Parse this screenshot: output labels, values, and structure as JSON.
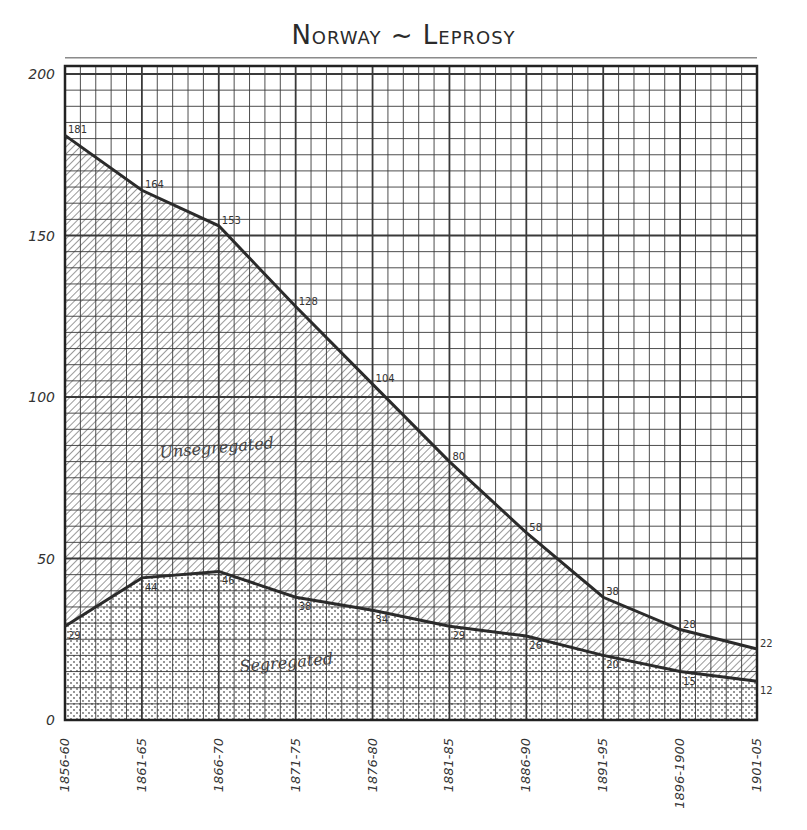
{
  "title": "Norway ~ Leprosy",
  "chart_data": {
    "type": "area",
    "title": "Norway ~ Leprosy",
    "xlabel": "",
    "ylabel": "",
    "ylim": [
      0,
      200
    ],
    "yticks": [
      0,
      50,
      100,
      150,
      200
    ],
    "grid": true,
    "legend": "inline labels",
    "categories": [
      "1856-60",
      "1861-65",
      "1866-70",
      "1871-75",
      "1876-80",
      "1881-85",
      "1886-90",
      "1891-95",
      "1896-1900",
      "1901-05"
    ],
    "series": [
      {
        "name": "Total (top line)",
        "values": [
          181,
          164,
          153,
          128,
          104,
          80,
          58,
          38,
          28,
          22
        ]
      },
      {
        "name": "Segregated",
        "values": [
          29,
          44,
          46,
          38,
          34,
          29,
          26,
          20,
          15,
          12
        ]
      }
    ],
    "area_labels": {
      "upper": "Unsegregated",
      "lower": "Segregated"
    }
  },
  "colors": {
    "line": "#2b2b2b",
    "grid": "#3a3a3a",
    "background": "#ffffff"
  }
}
